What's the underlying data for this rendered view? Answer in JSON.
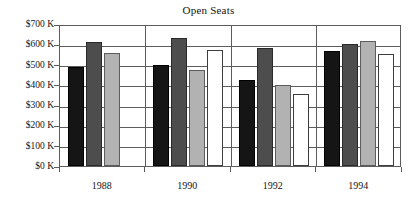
{
  "chart_data": {
    "type": "bar",
    "title": "Open Seats",
    "xlabel": "",
    "ylabel": "",
    "categories": [
      "1988",
      "1990",
      "1992",
      "1994"
    ],
    "series": [
      {
        "name": "series-1",
        "color": "#151515",
        "values": [
          490,
          497,
          423,
          568
        ]
      },
      {
        "name": "series-2",
        "color": "#4d4d4d",
        "values": [
          612,
          632,
          580,
          601
        ]
      },
      {
        "name": "series-3",
        "color": "#b2b2b2",
        "values": [
          474,
          474,
          397,
          618
        ]
      },
      {
        "name": "series-4",
        "color": "#ffffff",
        "values": [
          0,
          573,
          356,
          553
        ]
      }
    ],
    "series_overrides": {
      "note": "1988 series-3 is 557; 1988 series-4 not drawn"
    },
    "ylim": [
      0,
      700
    ],
    "ytick_values": [
      0,
      100,
      200,
      300,
      400,
      500,
      600,
      700
    ],
    "ytick_labels": [
      "$0 K",
      "$100 K",
      "$200 K",
      "$300 K",
      "$400 K",
      "$500 K",
      "$600 K",
      "$700 K"
    ],
    "grid": "horizontal",
    "legend": "none",
    "bar_values_by_group": [
      [
        490,
        612,
        557,
        0
      ],
      [
        497,
        632,
        474,
        573
      ],
      [
        423,
        580,
        397,
        356
      ],
      [
        568,
        601,
        618,
        553
      ]
    ]
  },
  "axis": {
    "y_labels": [
      "$700 K",
      "$600 K",
      "$500 K",
      "$400 K",
      "$300 K",
      "$200 K",
      "$100 K",
      "$0 K"
    ],
    "x_labels": [
      "1988",
      "1990",
      "1992",
      "1994"
    ]
  },
  "title": {
    "text": "Open Seats"
  }
}
